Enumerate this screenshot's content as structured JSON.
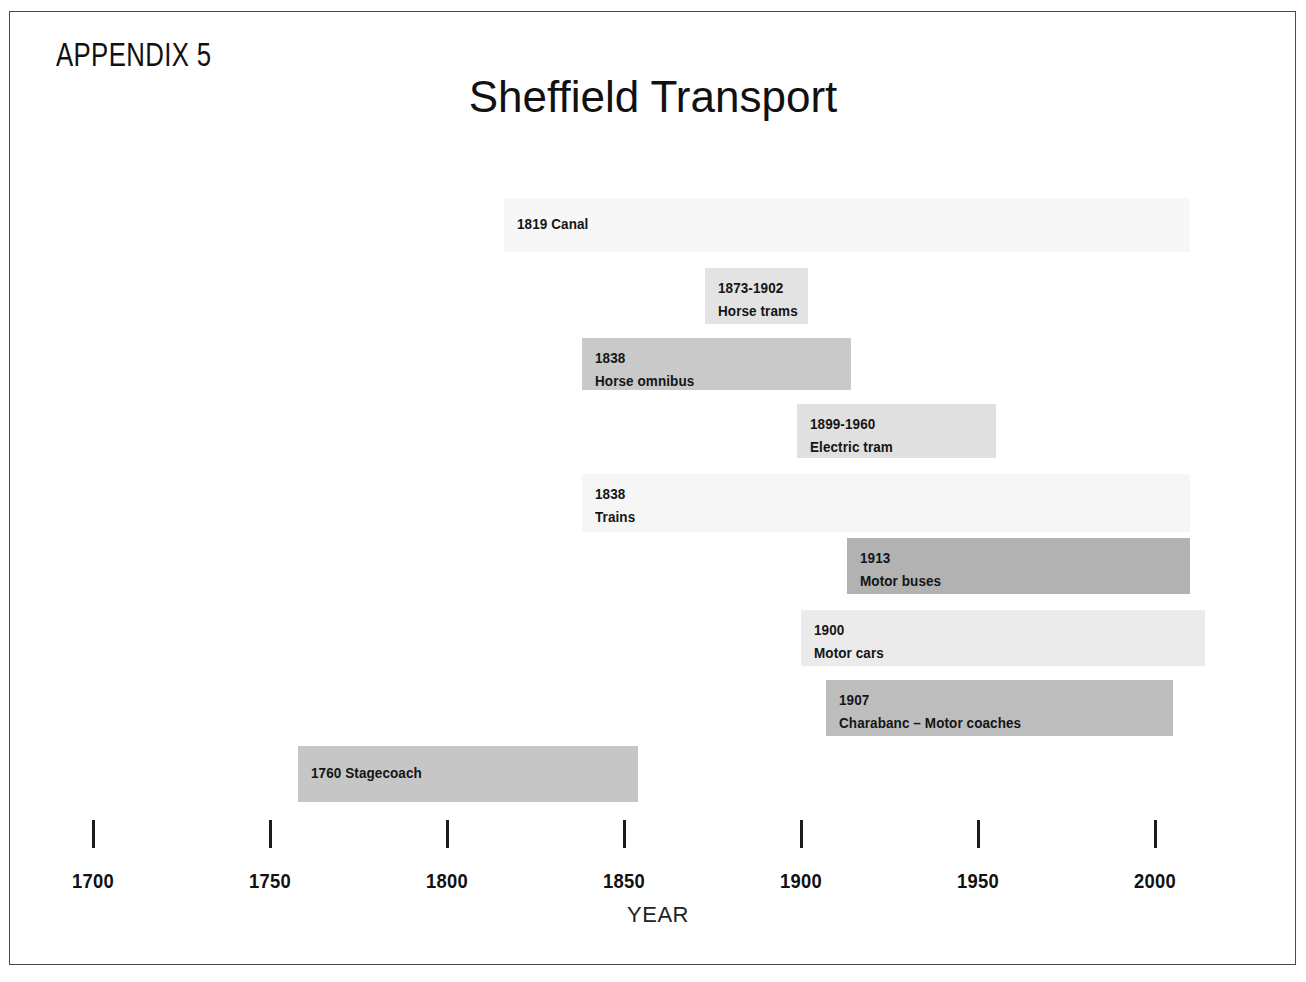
{
  "page": {
    "appendix_label": "APPENDIX 5",
    "title": "Sheffield Transport"
  },
  "chart_data": {
    "type": "bar",
    "orientation": "horizontal-timeline",
    "title": "Sheffield Transport",
    "xlabel": "YEAR",
    "ylabel": "",
    "xlim": [
      1700,
      2010
    ],
    "grid": false,
    "legend": false,
    "axis_ticks": [
      1700,
      1750,
      1800,
      1850,
      1900,
      1950,
      2000
    ],
    "tick_labels": [
      "1700",
      "1750",
      "1800",
      "1850",
      "1900",
      "1950",
      "2000"
    ],
    "categories": [
      "Canal",
      "Horse trams",
      "Horse omnibus",
      "Electric tram",
      "Trains",
      "Motor buses",
      "Motor cars",
      "Charabanc – Motor coaches",
      "Stagecoach"
    ],
    "bars": [
      {
        "name": "Canal",
        "date_text": "1819",
        "label_text": "1819 Canal",
        "label_lines": [
          "1819 Canal"
        ],
        "start": 1816,
        "end": 2010,
        "color": "#f7f7f7",
        "row": 0
      },
      {
        "name": "Horse trams",
        "date_text": "1873-1902",
        "label_text": "1873-1902 Horse trams",
        "label_lines": [
          "1873-1902",
          "Horse trams"
        ],
        "start": 1873,
        "end": 1902,
        "color": "#e3e3e3",
        "row": 1
      },
      {
        "name": "Horse omnibus",
        "date_text": "1838",
        "label_text": "1838 Horse omnibus",
        "label_lines": [
          "1838",
          "Horse omnibus"
        ],
        "start": 1838,
        "end": 1914,
        "color": "#c9c9c9",
        "row": 2
      },
      {
        "name": "Electric tram",
        "date_text": "1899-1960",
        "label_text": "1899-1960 Electric tram",
        "label_lines": [
          "1899-1960",
          "Electric tram"
        ],
        "start": 1899,
        "end": 1955,
        "color": "#e0e0e0",
        "row": 3
      },
      {
        "name": "Trains",
        "date_text": "1838",
        "label_text": "1838 Trains",
        "label_lines": [
          "1838",
          "Trains"
        ],
        "start": 1838,
        "end": 2010,
        "color": "#f6f6f6",
        "row": 4
      },
      {
        "name": "Motor buses",
        "date_text": "1913",
        "label_text": "1913 Motor buses",
        "label_lines": [
          "1913",
          "Motor buses"
        ],
        "start": 1913,
        "end": 2010,
        "color": "#b2b2b2",
        "row": 5
      },
      {
        "name": "Motor cars",
        "date_text": "1900",
        "label_text": "1900 Motor cars",
        "label_lines": [
          "1900",
          "Motor cars"
        ],
        "start": 1900,
        "end": 2014,
        "color": "#ebebeb",
        "row": 6
      },
      {
        "name": "Charabanc – Motor coaches",
        "date_text": "1907",
        "label_text": "1907 Charabanc – Motor coaches",
        "label_lines": [
          "1907",
          "Charabanc – Motor coaches"
        ],
        "start": 1907,
        "end": 2005,
        "color": "#bdbdbd",
        "row": 7
      },
      {
        "name": "Stagecoach",
        "date_text": "1760",
        "label_text": "1760 Stagecoach",
        "label_lines": [
          "1760 Stagecoach"
        ],
        "start": 1758,
        "end": 1854,
        "color": "#c6c6c6",
        "row": 8
      }
    ]
  },
  "geometry": {
    "x_1700_px": 93,
    "px_per_year": 3.54,
    "rows": [
      {
        "top": 198,
        "height": 54
      },
      {
        "top": 268,
        "height": 56
      },
      {
        "top": 338,
        "height": 52
      },
      {
        "top": 404,
        "height": 54
      },
      {
        "top": 474,
        "height": 58
      },
      {
        "top": 538,
        "height": 56
      },
      {
        "top": 610,
        "height": 56
      },
      {
        "top": 680,
        "height": 56
      },
      {
        "top": 746,
        "height": 56
      }
    ],
    "axis_tick_y": 820,
    "axis_tick_height": 28,
    "axis_label_y": 870,
    "axis_title_x": 658
  }
}
